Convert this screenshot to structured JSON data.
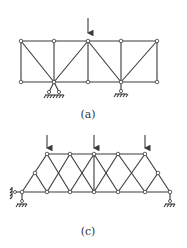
{
  "figures": [
    {
      "id": "a",
      "caption": "(a)",
      "description": "Truss with 5 top and 5 bottom nodes, one vertical point load at top middle node, pin support and roller support on bottom chord",
      "nodes": [
        [
          21,
          41
        ],
        [
          54,
          41
        ],
        [
          88,
          41
        ],
        [
          121,
          41
        ],
        [
          157,
          41
        ],
        [
          21,
          82
        ],
        [
          54,
          82
        ],
        [
          88,
          82
        ],
        [
          121,
          82
        ],
        [
          157,
          82
        ]
      ],
      "members": [
        [
          0,
          1
        ],
        [
          1,
          2
        ],
        [
          2,
          3
        ],
        [
          3,
          4
        ],
        [
          5,
          6
        ],
        [
          6,
          7
        ],
        [
          7,
          8
        ],
        [
          8,
          9
        ],
        [
          0,
          5
        ],
        [
          1,
          6
        ],
        [
          2,
          7
        ],
        [
          3,
          8
        ],
        [
          4,
          9
        ],
        [
          0,
          6
        ],
        [
          6,
          2
        ],
        [
          2,
          8
        ],
        [
          8,
          4
        ]
      ],
      "loads": [
        {
          "node": 2
        }
      ],
      "supports": [
        {
          "node": 6,
          "type": "pin"
        },
        {
          "node": 8,
          "type": "roller"
        }
      ]
    },
    {
      "id": "c",
      "caption": "(c)",
      "description": "Trapezoidal cross-braced truss with three vertical point loads on top chord, pinned left end with lateral restraint and roller right end",
      "loads_count": 3
    }
  ],
  "colors": {
    "line": "#3a3a3a",
    "background": "#ffffff"
  }
}
